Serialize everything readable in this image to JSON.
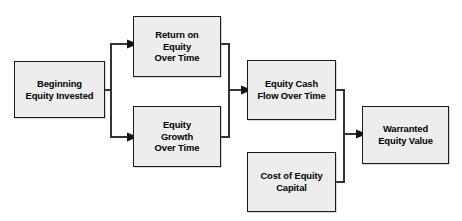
{
  "diagram": {
    "background_color": "#ffffff",
    "node_fill_color": "#ededed",
    "node_border_color": "#1a1a1a",
    "connector_color": "#333333",
    "text_color": "#000000",
    "nodes": [
      {
        "id": "beginning-equity-invested",
        "label": "Beginning\nEquity Invested",
        "x": 14,
        "y": 61,
        "width": 91,
        "height": 57
      },
      {
        "id": "return-on-equity-over-time",
        "label": "Return on\nEquity\nOver Time",
        "x": 133,
        "y": 16,
        "width": 88,
        "height": 61
      },
      {
        "id": "equity-growth-over-time",
        "label": "Equity\nGrowth\nOver Time",
        "x": 133,
        "y": 106,
        "width": 88,
        "height": 61
      },
      {
        "id": "equity-cash-flow-over-time",
        "label": "Equity Cash\nFlow Over Time",
        "x": 247,
        "y": 60,
        "width": 89,
        "height": 60
      },
      {
        "id": "cost-of-equity-capital",
        "label": "Cost of Equity\nCapital",
        "x": 247,
        "y": 152,
        "width": 89,
        "height": 60
      },
      {
        "id": "warranted-equity-value",
        "label": "Warranted\nEquity Value",
        "x": 362,
        "y": 106,
        "width": 87,
        "height": 58
      }
    ],
    "connectors": [
      {
        "id": "beginning-to-return-on-equity",
        "from": "beginning-equity-invested",
        "to": "return-on-equity-over-time",
        "arrow": true
      },
      {
        "id": "beginning-to-equity-growth",
        "from": "beginning-equity-invested",
        "to": "equity-growth-over-time",
        "arrow": true
      },
      {
        "id": "return-on-equity-to-cash-flow",
        "from": "return-on-equity-over-time",
        "to": "equity-cash-flow-over-time",
        "arrow": true
      },
      {
        "id": "equity-growth-to-cash-flow",
        "from": "equity-growth-over-time",
        "to": "equity-cash-flow-over-time",
        "arrow": true
      },
      {
        "id": "cash-flow-to-warranted-value",
        "from": "equity-cash-flow-over-time",
        "to": "warranted-equity-value",
        "arrow": true
      },
      {
        "id": "cost-of-equity-to-warranted-value",
        "from": "cost-of-equity-capital",
        "to": "warranted-equity-value",
        "arrow": true
      }
    ]
  }
}
